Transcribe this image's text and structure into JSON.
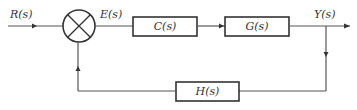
{
  "diagram": {
    "type": "feedback-control-block-diagram",
    "signals": {
      "input": "R(s)",
      "error": "E(s)",
      "output": "Y(s)"
    },
    "blocks": {
      "controller": "C(s)",
      "plant": "G(s)",
      "feedback": "H(s)"
    },
    "summing_junction": {
      "symbol": "cross-circle"
    },
    "colors": {
      "line": "#555555",
      "box_border": "#333333",
      "text": "#333333",
      "background": "#ffffff"
    }
  }
}
